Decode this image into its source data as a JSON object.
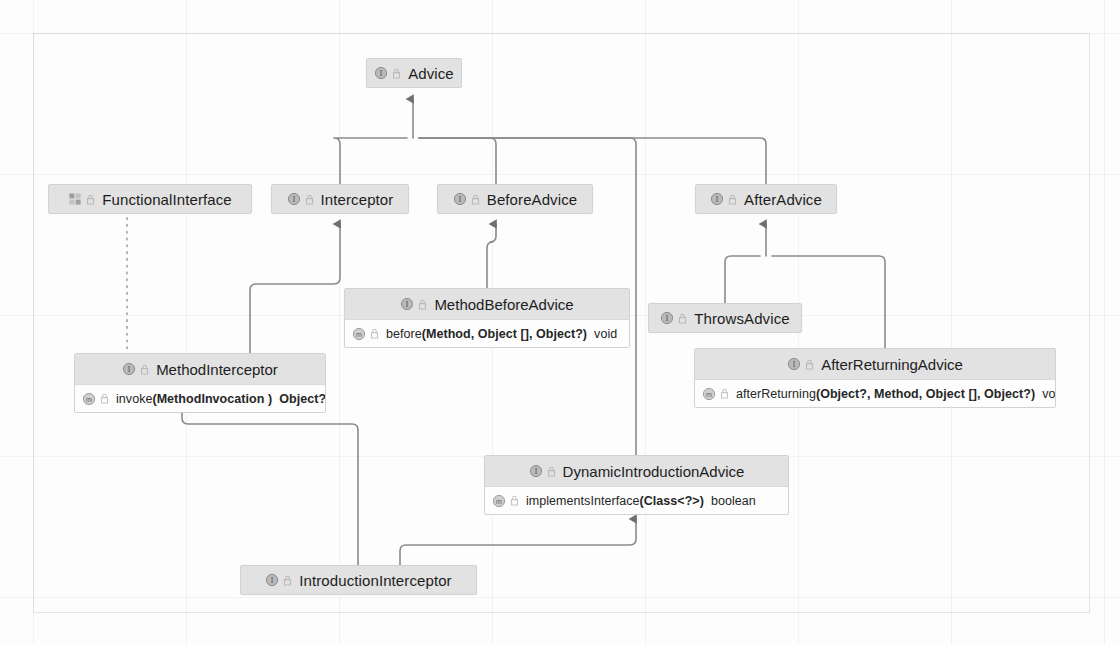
{
  "diagram": {
    "type": "uml-class-hierarchy",
    "background": "#fdfdfd",
    "node_fill": "#e2e2e2",
    "node_border": "#d2d2d2",
    "edge_color": "#8a8a8a",
    "grid_color": "#7882a0"
  },
  "icons": {
    "interface": "interface-icon",
    "annotation": "annotation-icon",
    "method": "method-icon",
    "visibility": "visibility-marker-icon"
  },
  "nodes": [
    {
      "id": "advice",
      "label": "Advice",
      "icon": "interface"
    },
    {
      "id": "functional_interface",
      "label": "FunctionalInterface",
      "icon": "annotation"
    },
    {
      "id": "interceptor",
      "label": "Interceptor",
      "icon": "interface"
    },
    {
      "id": "before_advice",
      "label": "BeforeAdvice",
      "icon": "interface"
    },
    {
      "id": "after_advice",
      "label": "AfterAdvice",
      "icon": "interface"
    },
    {
      "id": "throws_advice",
      "label": "ThrowsAdvice",
      "icon": "interface"
    },
    {
      "id": "introduction_interceptor",
      "label": "IntroductionInterceptor",
      "icon": "interface"
    }
  ],
  "composites": [
    {
      "id": "method_before_advice",
      "label": "MethodBeforeAdvice",
      "icon": "interface",
      "members": [
        {
          "icon": "method",
          "name": "before",
          "params": "(Method, Object [], Object?)",
          "returns": "void"
        }
      ]
    },
    {
      "id": "method_interceptor",
      "label": "MethodInterceptor",
      "icon": "interface",
      "members": [
        {
          "icon": "method",
          "name": "invoke",
          "params": "(MethodInvocation )",
          "returns": "Object?"
        }
      ]
    },
    {
      "id": "after_returning_advice",
      "label": "AfterReturningAdvice",
      "icon": "interface",
      "members": [
        {
          "icon": "method",
          "name": "afterReturning",
          "params": "(Object?, Method, Object [], Object?)",
          "returns": "void"
        }
      ]
    },
    {
      "id": "dynamic_introduction_advice",
      "label": "DynamicIntroductionAdvice",
      "icon": "interface",
      "members": [
        {
          "icon": "method",
          "name": "implementsInterface",
          "params": "(Class<?>)",
          "returns": "boolean"
        }
      ]
    }
  ],
  "edges": [
    {
      "from": "interceptor",
      "to": "advice",
      "style": "solid",
      "arrow": "triangle"
    },
    {
      "from": "before_advice",
      "to": "advice",
      "style": "solid",
      "arrow": "triangle"
    },
    {
      "from": "after_advice",
      "to": "advice",
      "style": "solid",
      "arrow": "triangle"
    },
    {
      "from": "dynamic_introduction_advice",
      "to": "advice",
      "style": "solid",
      "arrow": "triangle"
    },
    {
      "from": "method_interceptor",
      "to": "interceptor",
      "style": "solid",
      "arrow": "triangle"
    },
    {
      "from": "method_before_advice",
      "to": "before_advice",
      "style": "solid",
      "arrow": "triangle"
    },
    {
      "from": "throws_advice",
      "to": "after_advice",
      "style": "solid",
      "arrow": "triangle"
    },
    {
      "from": "after_returning_advice",
      "to": "after_advice",
      "style": "solid",
      "arrow": "triangle"
    },
    {
      "from": "introduction_interceptor",
      "to": "method_interceptor",
      "style": "solid",
      "arrow": "triangle"
    },
    {
      "from": "introduction_interceptor",
      "to": "dynamic_introduction_advice",
      "style": "solid",
      "arrow": "triangle"
    },
    {
      "from": "functional_interface",
      "to": "method_interceptor",
      "style": "dotted",
      "arrow": "none"
    }
  ]
}
